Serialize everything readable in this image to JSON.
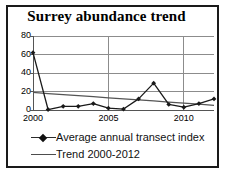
{
  "chart_data": {
    "type": "line",
    "title": "Surrey abundance trend",
    "xlabel": "",
    "ylabel": "",
    "x": [
      2000,
      2001,
      2002,
      2003,
      2004,
      2005,
      2006,
      2007,
      2008,
      2009,
      2010,
      2011,
      2012
    ],
    "xlim": [
      2000,
      2012
    ],
    "ylim": [
      0,
      80
    ],
    "yticks": [
      0,
      20,
      40,
      60,
      80
    ],
    "ytick_labels": [
      "0",
      "20",
      "40",
      "60",
      "80"
    ],
    "xticks": [
      2000,
      2005,
      2010
    ],
    "xtick_labels": [
      "2000",
      "2005",
      "2010"
    ],
    "grid": "horizontal-and-vertical-at-xticks",
    "legend_position": "below-plot-left",
    "series": [
      {
        "name": "Average annual transect index",
        "marker": "filled-diamond",
        "color": "#1a1a1a",
        "values": [
          62,
          0.5,
          4,
          4,
          7,
          2,
          1,
          12,
          29,
          6,
          3,
          7,
          12
        ]
      },
      {
        "name": "Trend 2000-2012",
        "marker": "none",
        "color": "#555555",
        "values": [
          19,
          17.8,
          16.7,
          15.5,
          14.4,
          13.2,
          12.1,
          10.9,
          9.8,
          8.6,
          7.5,
          6.3,
          5
        ]
      }
    ]
  },
  "legend": {
    "entries": [
      {
        "label": "Average annual transect index"
      },
      {
        "label": "Trend 2000-2012"
      }
    ]
  },
  "colors": {
    "border": "#1a1a1a",
    "grid": "#8c8c8c",
    "axis": "#555555",
    "series_main": "#1a1a1a",
    "series_trend": "#555555",
    "background": "#ffffff"
  }
}
